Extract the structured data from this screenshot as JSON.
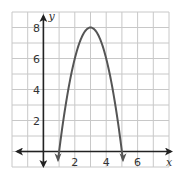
{
  "chart_data": {
    "type": "line",
    "title": "",
    "xlabel": "x",
    "ylabel": "y",
    "xlim": [
      -2,
      8
    ],
    "ylim": [
      -1,
      9
    ],
    "grid": true,
    "grid_step": 1,
    "x_ticks": [
      2,
      4,
      6
    ],
    "x_tick_labels": [
      "2",
      "4",
      "6"
    ],
    "y_ticks": [
      2,
      4,
      6,
      8
    ],
    "y_tick_labels": [
      "2",
      "4",
      "6",
      "8"
    ],
    "series": [
      {
        "name": "parabola",
        "equation": "y = -2(x - 3)^2 + 8",
        "vertex": [
          3,
          8
        ],
        "x_intercepts": [
          1,
          5
        ],
        "x": [
          0.93,
          1,
          1.5,
          2,
          2.5,
          3,
          3.5,
          4,
          4.5,
          5,
          5.07
        ],
        "values": [
          -0.57,
          0,
          3.5,
          6,
          7.5,
          8,
          7.5,
          6,
          3.5,
          0,
          -0.57
        ],
        "arrows_both_ends": true,
        "color": "#555555"
      }
    ],
    "axes": {
      "x_axis_arrows": "both",
      "y_axis_arrows": "both",
      "axis_color": "#222222"
    },
    "grid_color": "#c8c8c8"
  }
}
